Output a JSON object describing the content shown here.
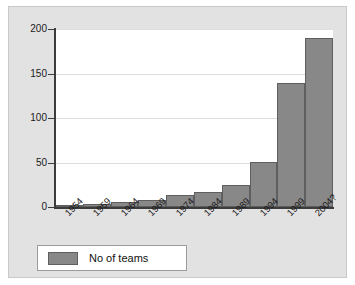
{
  "chart_data": {
    "type": "bar",
    "title": "",
    "subtitle": "",
    "xlabel": "",
    "ylabel": "",
    "categories": [
      "1954",
      "1959",
      "1964",
      "1969",
      "1974",
      "1984",
      "1989",
      "1994",
      "1999",
      "2004?"
    ],
    "values": [
      1,
      3,
      6,
      8,
      13,
      17,
      25,
      51,
      139,
      190
    ],
    "series": [
      {
        "name": "No of teams",
        "values": [
          1,
          3,
          6,
          8,
          13,
          17,
          25,
          51,
          139,
          190
        ],
        "color": "#888888"
      }
    ],
    "ylim": [
      0,
      200
    ],
    "yticks": [
      0,
      50,
      100,
      150,
      200
    ],
    "ytick_labels": [
      "0",
      "50",
      "100",
      "150",
      "200"
    ],
    "grid": true,
    "grid_axis": "y",
    "legend_position": "bottom-left",
    "xtick_rotation": -45
  },
  "legend": {
    "entries": [
      {
        "label": "No of teams",
        "color": "#888888"
      }
    ]
  },
  "style": {
    "panel_background": "#e2e2e2",
    "plot_background": "#ffffff",
    "bar_color": "#888888",
    "bar_border": "#5f5f5f",
    "axis_color": "#3c3c3c",
    "grid_color": "#dedede",
    "text_color": "#1a1a1a"
  }
}
